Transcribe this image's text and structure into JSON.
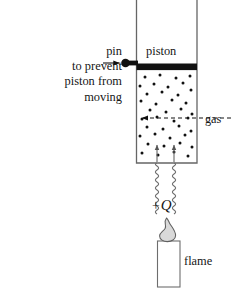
{
  "figure": {
    "background_color": "#ffffff",
    "ink_color": "#161616"
  },
  "labels": {
    "pin": "pin",
    "annotation_lines": [
      "to prevent",
      "piston from",
      "moving"
    ],
    "piston": "piston",
    "gas": "gas",
    "heat_sign": "+",
    "heat_symbol": "Q",
    "flame": "flame"
  },
  "diagram": {
    "cylinder": {
      "name": "cylinder",
      "left": 136,
      "right": 197,
      "top": 0,
      "bottom": 163,
      "stroke": "#555555",
      "stroke_width": 1.3,
      "fill": "#ffffff",
      "open_top": true
    },
    "piston": {
      "name": "piston-bar",
      "x": 136,
      "y": 63.5,
      "width": 61,
      "height": 6.5,
      "fill": "#111111"
    },
    "pin": {
      "name": "pin",
      "head_cx": 125.5,
      "head_cy": 63.0,
      "head_r": 4.2,
      "stem_x": 125.5,
      "stem_y": 60.6,
      "stem_width": 12,
      "stem_height": 4.6,
      "fill": "#111111",
      "arrow_from_x": 104,
      "arrow_to_x": 120,
      "arrow_y": 63.0
    },
    "gas_region": {
      "name": "gas-region",
      "top": 70,
      "bottom": 163,
      "dot_color": "#111111",
      "dot_radius": 1.5,
      "dots": [
        [
          145,
          77
        ],
        [
          160,
          75
        ],
        [
          176,
          78
        ],
        [
          190,
          76
        ],
        [
          140,
          86
        ],
        [
          154,
          84
        ],
        [
          168,
          87
        ],
        [
          183,
          83
        ],
        [
          147,
          94
        ],
        [
          162,
          92
        ],
        [
          178,
          95
        ],
        [
          191,
          90
        ],
        [
          141,
          101
        ],
        [
          156,
          104
        ],
        [
          172,
          100
        ],
        [
          186,
          103
        ],
        [
          150,
          110
        ],
        [
          166,
          112
        ],
        [
          181,
          109
        ],
        [
          192,
          114
        ],
        [
          142,
          119
        ],
        [
          157,
          117
        ],
        [
          174,
          121
        ],
        [
          188,
          118
        ],
        [
          147,
          127
        ],
        [
          163,
          129
        ],
        [
          179,
          126
        ],
        [
          191,
          131
        ],
        [
          140,
          136
        ],
        [
          155,
          134
        ],
        [
          170,
          138
        ],
        [
          185,
          135
        ],
        [
          148,
          144
        ],
        [
          164,
          146
        ],
        [
          180,
          143
        ],
        [
          192,
          147
        ],
        [
          142,
          153
        ],
        [
          158,
          155
        ],
        [
          174,
          152
        ],
        [
          188,
          156
        ]
      ]
    },
    "gas_pointer": {
      "name": "gas-dashed-arrow",
      "from_x": 231,
      "to_x": 142,
      "y": 118,
      "dash": "4 3",
      "stroke": "#111111"
    },
    "inner_arrows": [
      {
        "name": "heat-inflow-arrow-left",
        "x": 157,
        "y_from": 163,
        "y_to": 144
      },
      {
        "name": "heat-inflow-arrow-right",
        "x": 174,
        "y_from": 163,
        "y_to": 144
      }
    ],
    "wavy_lines": [
      {
        "name": "heat-wave-left",
        "x": 157,
        "y_top": 163,
        "y_bottom": 214,
        "amplitude": 3.0,
        "period": 8.0
      },
      {
        "name": "heat-wave-right",
        "x": 174,
        "y_top": 163,
        "y_bottom": 214,
        "amplitude": 3.0,
        "period": 8.0
      }
    ],
    "candle": {
      "name": "candle-body",
      "x": 157,
      "y": 241,
      "width": 23,
      "height": 46,
      "fill": "#ffffff",
      "stroke": "#555555"
    },
    "flame": {
      "name": "flame-shape",
      "cx": 168,
      "base_y": 241,
      "tip_y": 218,
      "half_width": 9,
      "fill": "#d8d8d8",
      "stroke": "#555555"
    }
  }
}
